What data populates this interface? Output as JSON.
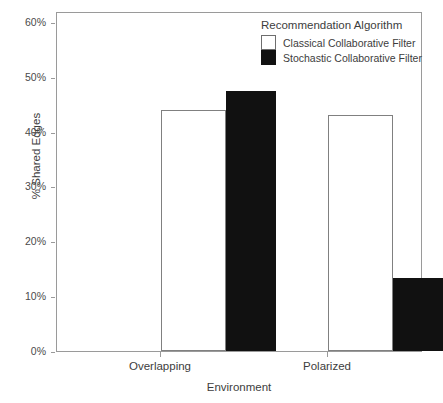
{
  "chart_data": {
    "type": "bar",
    "title": "",
    "xlabel": "Environment",
    "ylabel": "% Shared Edges",
    "categories": [
      "Overlapping",
      "Polarized"
    ],
    "series": [
      {
        "name": "Classical Collaborative Filter",
        "values": [
          44,
          43
        ],
        "color": "#ffffff"
      },
      {
        "name": "Stochastic Collaborative Filter",
        "values": [
          47.5,
          13.3
        ],
        "color": "#111111"
      }
    ],
    "ylim": [
      0,
      62
    ],
    "yticks": [
      0,
      10,
      20,
      30,
      40,
      50,
      60
    ],
    "ytick_labels": [
      "0%",
      "10%",
      "20%",
      "30%",
      "40%",
      "50%",
      "60%"
    ],
    "grid": false,
    "legend_position": "top-right",
    "legend_title": "Recommendation Algorithm"
  },
  "legend": {
    "title": "Recommendation Algorithm",
    "entries": [
      {
        "label": "Classical Collaborative Filter",
        "swatch": "light"
      },
      {
        "label": "Stochastic Collaborative Filter",
        "swatch": "dark"
      }
    ]
  },
  "axes": {
    "y_label": "% Shared Edges",
    "x_label": "Environment"
  }
}
